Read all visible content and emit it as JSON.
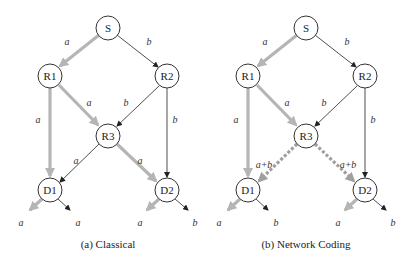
{
  "diagrams": [
    {
      "id": "classical",
      "caption": "(a) Classical",
      "offset_x": 0,
      "nodes": {
        "S": {
          "label": "S"
        },
        "R1": {
          "label": "R1"
        },
        "R2": {
          "label": "R2"
        },
        "R3": {
          "label": "R3"
        },
        "D1": {
          "label": "D1"
        },
        "D2": {
          "label": "D2"
        }
      },
      "edges": [
        {
          "from": "S",
          "to": "R1",
          "label": "a",
          "style": "thick"
        },
        {
          "from": "S",
          "to": "R2",
          "label": "b",
          "style": "thin"
        },
        {
          "from": "R1",
          "to": "D1",
          "label": "a",
          "style": "thick"
        },
        {
          "from": "R1",
          "to": "R3",
          "label": "a",
          "style": "thick"
        },
        {
          "from": "R2",
          "to": "R3",
          "label": "b",
          "style": "thin"
        },
        {
          "from": "R2",
          "to": "D2",
          "label": "b",
          "style": "thin"
        },
        {
          "from": "R3",
          "to": "D1",
          "label": "a",
          "style": "thin"
        },
        {
          "from": "R3",
          "to": "D2",
          "label": "a",
          "style": "thick"
        }
      ],
      "outputs": {
        "D1_left": "a",
        "D1_right": "a",
        "D2_left": "a",
        "D2_right": "b"
      }
    },
    {
      "id": "network-coding",
      "caption": "(b) Network Coding",
      "offset_x": 198,
      "nodes": {
        "S": {
          "label": "S"
        },
        "R1": {
          "label": "R1"
        },
        "R2": {
          "label": "R2"
        },
        "R3": {
          "label": "R3"
        },
        "D1": {
          "label": "D1"
        },
        "D2": {
          "label": "D2"
        }
      },
      "edges": [
        {
          "from": "S",
          "to": "R1",
          "label": "a",
          "style": "thick"
        },
        {
          "from": "S",
          "to": "R2",
          "label": "b",
          "style": "thin"
        },
        {
          "from": "R1",
          "to": "D1",
          "label": "a",
          "style": "thick"
        },
        {
          "from": "R1",
          "to": "R3",
          "label": "a",
          "style": "thick"
        },
        {
          "from": "R2",
          "to": "R3",
          "label": "b",
          "style": "thin"
        },
        {
          "from": "R2",
          "to": "D2",
          "label": "b",
          "style": "thin"
        },
        {
          "from": "R3",
          "to": "D1",
          "label": "a+b",
          "style": "dashed"
        },
        {
          "from": "R3",
          "to": "D2",
          "label": "a+b",
          "style": "dashed"
        }
      ],
      "outputs": {
        "D1_left": "a",
        "D1_right": "b",
        "D2_left": "a",
        "D2_right": "b"
      }
    }
  ],
  "colors": {
    "thin_edge": "#222222",
    "thick_edge": "#b5b5b5",
    "dashed_edge": "#a0a0a0"
  }
}
